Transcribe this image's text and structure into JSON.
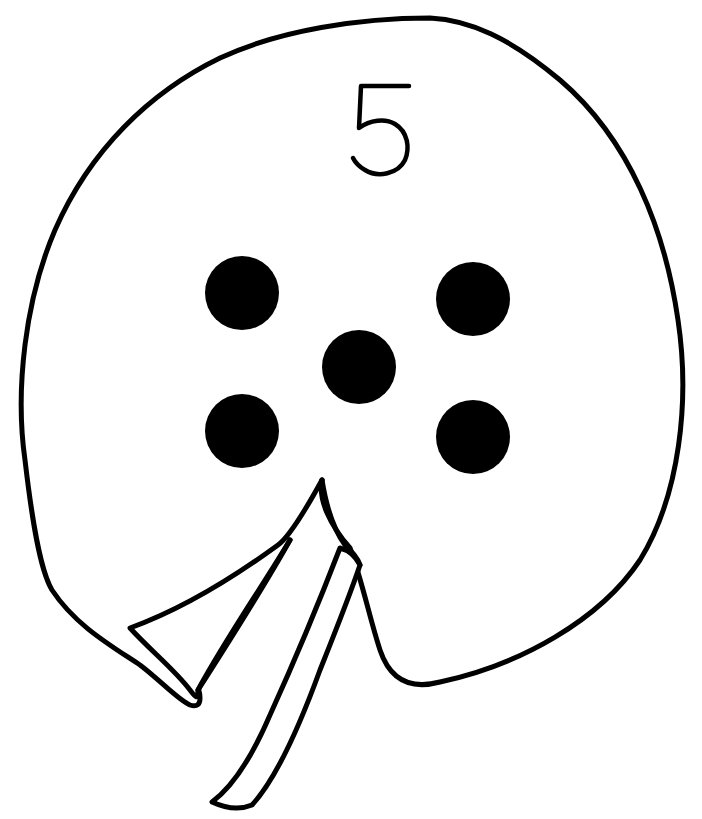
{
  "illustration": {
    "subject": "lily pad counting card",
    "numeral": "5",
    "dot_count": 5,
    "colors": {
      "background": "#ffffff",
      "ink": "#000000"
    },
    "dots": [
      {
        "cx": 242,
        "cy": 293,
        "r": 37
      },
      {
        "cx": 473,
        "cy": 299,
        "r": 37
      },
      {
        "cx": 359,
        "cy": 367,
        "r": 37
      },
      {
        "cx": 242,
        "cy": 431,
        "r": 37
      },
      {
        "cx": 473,
        "cy": 437,
        "r": 37
      }
    ]
  }
}
